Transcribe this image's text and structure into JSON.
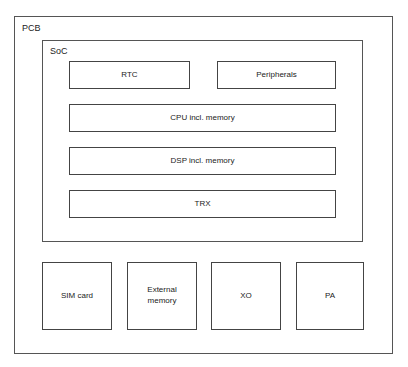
{
  "diagram": {
    "pcb": {
      "label": "PCB"
    },
    "soc": {
      "label": "SoC",
      "blocks": [
        {
          "id": "rtc",
          "label": "RTC"
        },
        {
          "id": "peripherals",
          "label": "Peripherals"
        },
        {
          "id": "cpu",
          "label": "CPU incl. memory"
        },
        {
          "id": "dsp",
          "label": "DSP incl. memory"
        },
        {
          "id": "trx",
          "label": "TRX"
        }
      ]
    },
    "external_components": [
      {
        "id": "sim",
        "label": "SIM card"
      },
      {
        "id": "external-memory",
        "label": "External\nmemory"
      },
      {
        "id": "xo",
        "label": "XO"
      },
      {
        "id": "pa",
        "label": "PA"
      }
    ],
    "colors": {
      "line": "#444444",
      "background": "#ffffff",
      "text": "#222222"
    }
  }
}
